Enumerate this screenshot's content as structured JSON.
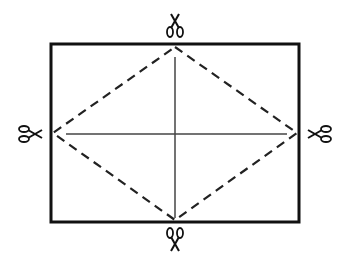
{
  "diagram": {
    "rectangle": {
      "x": 51,
      "y": 44,
      "width": 248,
      "height": 178,
      "stroke": "#111111",
      "stroke_width": 3
    },
    "diamond": {
      "points": [
        [
          175,
          47
        ],
        [
          297,
          133
        ],
        [
          175,
          220
        ],
        [
          53,
          133
        ]
      ],
      "stroke": "#222222",
      "dash": "9,6",
      "stroke_width": 2.2
    },
    "vertical_line": {
      "x1": 175,
      "y1": 57,
      "x2": 175,
      "y2": 218,
      "stroke": "#444444"
    },
    "horizontal_line": {
      "x1": 66,
      "y1": 134,
      "x2": 287,
      "y2": 134,
      "stroke": "#444444"
    },
    "scissors": [
      {
        "name": "scissors-top-icon",
        "x": 175,
        "y": 25,
        "rotate": 90
      },
      {
        "name": "scissors-bottom-icon",
        "x": 175,
        "y": 240,
        "rotate": 270
      },
      {
        "name": "scissors-left-icon",
        "x": 30,
        "y": 134,
        "rotate": 0
      },
      {
        "name": "scissors-right-icon",
        "x": 320,
        "y": 134,
        "rotate": 180
      }
    ]
  }
}
